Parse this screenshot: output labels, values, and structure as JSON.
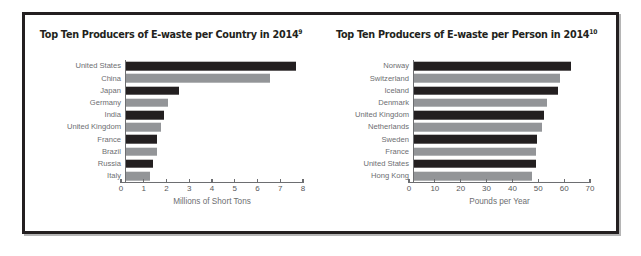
{
  "figure": {
    "background_color": "#ffffff",
    "border_color": "#231f20",
    "bar_dark_color": "#231f20",
    "bar_gray_color": "#939598",
    "label_color": "#6d6e71"
  },
  "chart_data": [
    {
      "type": "bar",
      "orientation": "horizontal",
      "title": "Top Ten Producers of E-waste per Country in 2014",
      "title_superscript": "9",
      "xlabel": "Millions of Short Tons",
      "ylabel": "",
      "xlim": [
        0,
        8
      ],
      "xticks": [
        0,
        1,
        2,
        3,
        4,
        5,
        6,
        7,
        8
      ],
      "xticklabels": [
        "0",
        "1",
        "2",
        "3",
        "4",
        "5",
        "6",
        "7",
        "8"
      ],
      "grid": false,
      "legend": "none",
      "categories": [
        "United States",
        "China",
        "Japan",
        "Germany",
        "India",
        "United Kingdom",
        "France",
        "Brazil",
        "Russia",
        "Italy"
      ],
      "values": [
        7.7,
        6.5,
        2.4,
        1.9,
        1.7,
        1.6,
        1.4,
        1.4,
        1.2,
        1.1
      ],
      "bar_colors": [
        "dark",
        "gray",
        "dark",
        "gray",
        "dark",
        "gray",
        "dark",
        "gray",
        "dark",
        "gray"
      ]
    },
    {
      "type": "bar",
      "orientation": "horizontal",
      "title": "Top Ten Producers of E-waste per Person in 2014",
      "title_superscript": "10",
      "xlabel": "Pounds per Year",
      "ylabel": "",
      "xlim": [
        0,
        70
      ],
      "xticks": [
        0,
        10,
        20,
        30,
        40,
        50,
        60,
        70
      ],
      "xticklabels": [
        "0",
        "10",
        "20",
        "30",
        "40",
        "50",
        "60",
        "70"
      ],
      "grid": false,
      "legend": "none",
      "categories": [
        "Norway",
        "Switzerland",
        "Iceland",
        "Denmark",
        "United Kingdom",
        "Netherlands",
        "Sweden",
        "France",
        "United States",
        "Hong Kong"
      ],
      "values": [
        62.4,
        57.9,
        57.2,
        52.7,
        51.6,
        51.1,
        49.0,
        48.7,
        48.6,
        47.0
      ],
      "bar_colors": [
        "dark",
        "gray",
        "dark",
        "gray",
        "dark",
        "gray",
        "dark",
        "gray",
        "dark",
        "gray"
      ]
    }
  ]
}
